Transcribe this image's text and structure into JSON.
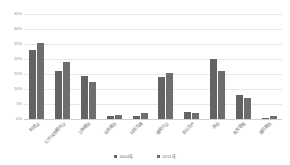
{
  "chart_data": {
    "type": "bar",
    "title": "",
    "xlabel": "",
    "ylabel": "",
    "ylim": [
      0,
      35
    ],
    "yunit": "%",
    "grid": true,
    "legend_position": "bottom",
    "categories": [
      "制造业",
      "公共设施服务业",
      "工商服务",
      "信息服务",
      "科技交通",
      "建筑行业",
      "农业生产",
      "其他",
      "批发零售",
      "居民服务"
    ],
    "yticks": [
      "35%",
      "30%",
      "25%",
      "20%",
      "15%",
      "10%",
      "5%",
      "0%"
    ],
    "ytick_values": [
      35,
      30,
      25,
      20,
      15,
      10,
      5,
      0
    ],
    "series": [
      {
        "name": "2004年",
        "color": "#636363",
        "values": [
          23.0,
          16.0,
          14.5,
          1.0,
          1.0,
          14.0,
          2.5,
          20.0,
          8.0,
          0.5
        ]
      },
      {
        "name": "2011年",
        "color": "#6e6e6e",
        "values": [
          25.5,
          19.0,
          12.5,
          1.5,
          2.0,
          15.5,
          2.0,
          16.0,
          7.0,
          1.0
        ]
      }
    ]
  }
}
